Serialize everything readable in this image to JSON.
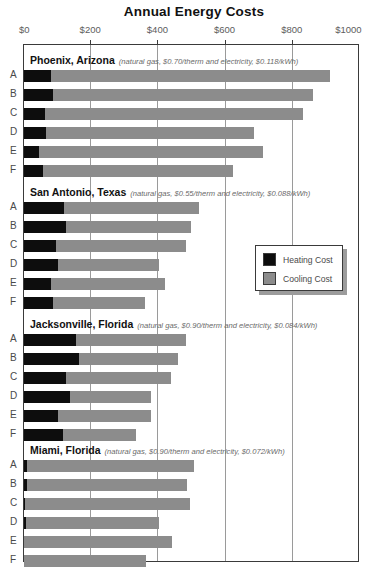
{
  "chart_data": {
    "type": "bar",
    "orientation": "horizontal",
    "stacked": true,
    "title": "Annual Energy Costs",
    "xlabel": "",
    "ylabel": "",
    "xlim": [
      0,
      1000
    ],
    "xticks": [
      0,
      200,
      400,
      600,
      800,
      1000
    ],
    "xtick_labels": [
      "$0",
      "$200",
      "$400",
      "$600",
      "$800",
      "$1000"
    ],
    "grid": true,
    "grid_axis": "x",
    "legend_position": "center-right",
    "series": [
      {
        "name": "Heating Cost",
        "color": "#0d0d0d"
      },
      {
        "name": "Cooling Cost",
        "color": "#8c8c8c"
      }
    ],
    "categories": [
      "A",
      "B",
      "C",
      "D",
      "E",
      "F"
    ],
    "groups": [
      {
        "city": "Phoenix, Arizona",
        "rates": "(natural gas, $0.70/therm and electricity, $0.118/kWh)",
        "gas_rate": "$0.70/therm",
        "electricity_rate": "$0.118/kWh",
        "rows": [
          {
            "label": "A",
            "heating": 80,
            "cooling": 830,
            "total": 910
          },
          {
            "label": "B",
            "heating": 86,
            "cooling": 774,
            "total": 860
          },
          {
            "label": "C",
            "heating": 62,
            "cooling": 768,
            "total": 830
          },
          {
            "label": "D",
            "heating": 65,
            "cooling": 620,
            "total": 685
          },
          {
            "label": "E",
            "heating": 45,
            "cooling": 667,
            "total": 712
          },
          {
            "label": "F",
            "heating": 57,
            "cooling": 565,
            "total": 622
          }
        ]
      },
      {
        "city": "San Antonio, Texas",
        "rates": "(natural gas, $0.55/therm and electricity, $0.088/kWh)",
        "gas_rate": "$0.55/therm",
        "electricity_rate": "$0.088/kWh",
        "rows": [
          {
            "label": "A",
            "heating": 119,
            "cooling": 402,
            "total": 521
          },
          {
            "label": "B",
            "heating": 125,
            "cooling": 372,
            "total": 497
          },
          {
            "label": "C",
            "heating": 95,
            "cooling": 387,
            "total": 482
          },
          {
            "label": "D",
            "heating": 101,
            "cooling": 300,
            "total": 401
          },
          {
            "label": "E",
            "heating": 80,
            "cooling": 339,
            "total": 419
          },
          {
            "label": "F",
            "heating": 86,
            "cooling": 274,
            "total": 360
          }
        ]
      },
      {
        "city": "Jacksonville, Florida",
        "rates": "(natural gas, $0.90/therm and electricity, $0.084/kWh)",
        "gas_rate": "$0.90/therm",
        "electricity_rate": "$0.084/kWh",
        "rows": [
          {
            "label": "A",
            "heating": 155,
            "cooling": 327,
            "total": 482
          },
          {
            "label": "B",
            "heating": 164,
            "cooling": 294,
            "total": 458
          },
          {
            "label": "C",
            "heating": 125,
            "cooling": 313,
            "total": 438
          },
          {
            "label": "D",
            "heating": 137,
            "cooling": 241,
            "total": 378
          },
          {
            "label": "E",
            "heating": 101,
            "cooling": 277,
            "total": 378
          },
          {
            "label": "F",
            "heating": 116,
            "cooling": 217,
            "total": 333
          }
        ]
      },
      {
        "city": "Miami, Florida",
        "rates": "(natural gas, $0.90/therm and electricity, $0.072/kWh)",
        "gas_rate": "$0.90/therm",
        "electricity_rate": "$0.072/kWh",
        "rows": [
          {
            "label": "A",
            "heating": 9,
            "cooling": 497,
            "total": 506
          },
          {
            "label": "B",
            "heating": 9,
            "cooling": 476,
            "total": 485
          },
          {
            "label": "C",
            "heating": 3,
            "cooling": 491,
            "total": 494
          },
          {
            "label": "D",
            "heating": 6,
            "cooling": 396,
            "total": 402
          },
          {
            "label": "E",
            "heating": 0,
            "cooling": 440,
            "total": 440
          },
          {
            "label": "F",
            "heating": 0,
            "cooling": 363,
            "total": 363
          }
        ]
      }
    ],
    "legend": [
      {
        "label": "Heating Cost",
        "color": "#0d0d0d"
      },
      {
        "label": "Cooling Cost",
        "color": "#8c8c8c"
      }
    ]
  }
}
